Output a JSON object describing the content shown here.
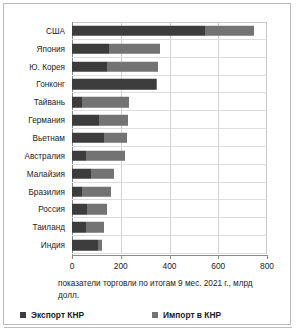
{
  "chart_data": {
    "type": "bar",
    "orientation": "horizontal",
    "stacked": true,
    "title": "",
    "caption": "показатели торговли по итогам 9 мес. 2021 г., млрд долл.",
    "xlabel": "",
    "ylabel": "",
    "xlim": [
      0,
      800
    ],
    "xticks": [
      0,
      200,
      400,
      600,
      800
    ],
    "xtick_labels": [
      "0",
      "200",
      "400",
      "600",
      "800"
    ],
    "grid": true,
    "legend_position": "bottom",
    "categories": [
      "США",
      "Япония",
      "Ю. Корея",
      "Гонконг",
      "Тайвань",
      "Германия",
      "Вьетнам",
      "Австралия",
      "Малайзия",
      "Бразилия",
      "Россия",
      "Таиланд",
      "Индия"
    ],
    "series": [
      {
        "name": "Экспорт КНР",
        "color": "#3c3c3c",
        "values": [
          545,
          150,
          145,
          345,
          40,
          110,
          133,
          58,
          78,
          40,
          60,
          57,
          105
        ]
      },
      {
        "name": "Импорт в КНР",
        "color": "#737373",
        "values": [
          200,
          212,
          207,
          5,
          195,
          118,
          92,
          159,
          94,
          120,
          83,
          73,
          20
        ]
      }
    ],
    "totals": [
      745,
      362,
      352,
      350,
      235,
      228,
      225,
      217,
      172,
      160,
      143,
      130,
      125
    ]
  },
  "legend": {
    "items": [
      {
        "label": "Экспорт КНР",
        "color": "#3c3c3c"
      },
      {
        "label": "Импорт в КНР",
        "color": "#737373"
      }
    ]
  }
}
